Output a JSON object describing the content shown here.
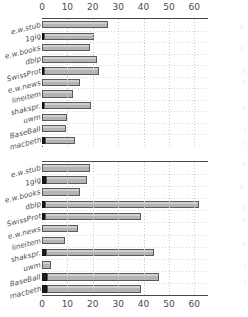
{
  "figure": {
    "background": "#ffffff",
    "bar_fill": "#bdbdbd",
    "bar_edge": "#5a5a5a",
    "bar_dark": "#1d1d1d",
    "axis_color": "#4a4a4a",
    "grid_color": "#c9c9c9"
  },
  "chart_data": [
    {
      "type": "bar",
      "id": "top",
      "orientation": "horizontal",
      "stacked": true,
      "title": "",
      "xlabel": "",
      "ylabel": "",
      "xlim": [
        0,
        65
      ],
      "xticks": [
        0,
        10,
        20,
        30,
        40,
        50,
        60
      ],
      "xticklabels": [
        "0",
        "10",
        "20",
        "30",
        "40",
        "50",
        "60"
      ],
      "grid": true,
      "legend": "none",
      "categories": [
        "e.w.stub",
        "1gig",
        "e.w.books",
        "dblp",
        "SwissProt",
        "e.w.news",
        "lineitem",
        "shakspr.",
        "uwm",
        "BaseBall",
        "macbeth"
      ],
      "series": [
        {
          "name": "dark",
          "values": [
            0.0,
            0.7,
            0.0,
            0.0,
            0.6,
            0.0,
            0.0,
            0.8,
            0.0,
            0.0,
            1.3
          ]
        },
        {
          "name": "light",
          "values": [
            26.0,
            19.6,
            19.0,
            21.5,
            21.8,
            14.8,
            12.2,
            18.4,
            10.0,
            9.4,
            11.8
          ]
        }
      ],
      "totals": [
        26.0,
        20.3,
        19.0,
        21.5,
        22.4,
        14.8,
        12.2,
        19.2,
        10.0,
        9.4,
        13.1
      ]
    },
    {
      "type": "bar",
      "id": "bottom",
      "orientation": "horizontal",
      "stacked": true,
      "title": "",
      "xlabel": "",
      "ylabel": "",
      "xlim": [
        0,
        65
      ],
      "xticks": [
        0,
        10,
        20,
        30,
        40,
        50,
        60
      ],
      "xticklabels": [
        "0",
        "10",
        "20",
        "30",
        "40",
        "50",
        "60"
      ],
      "grid": true,
      "legend": "none",
      "categories": [
        "e.w.stub",
        "1gig",
        "e.w.books",
        "dblp",
        "SwissProt",
        "e.w.news",
        "lineitem",
        "shakspr.",
        "uwm",
        "BaseBall",
        "macbeth"
      ],
      "series": [
        {
          "name": "dark",
          "values": [
            0.0,
            1.4,
            0.0,
            1.3,
            1.3,
            0.0,
            0.0,
            1.4,
            0.0,
            1.8,
            1.8
          ]
        },
        {
          "name": "light",
          "values": [
            19.0,
            16.4,
            14.8,
            60.7,
            37.7,
            14.0,
            9.2,
            42.6,
            3.6,
            44.2,
            37.2
          ]
        }
      ],
      "totals": [
        19.0,
        17.8,
        14.8,
        62.0,
        39.0,
        14.0,
        9.2,
        44.0,
        3.6,
        46.0,
        39.0
      ]
    }
  ],
  "ghost_labels": [
    "e.",
    "e.",
    "S",
    "e",
    "s",
    "l",
    "l",
    "e",
    "e.",
    "S",
    "e",
    "t",
    "l",
    "l"
  ]
}
